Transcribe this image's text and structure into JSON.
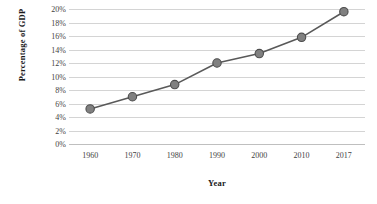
{
  "chart_data": {
    "type": "line",
    "title": "",
    "xlabel": "Year",
    "ylabel": "Percentage of GDP",
    "categories": [
      "1960",
      "1970",
      "1980",
      "1990",
      "2000",
      "2010",
      "2017"
    ],
    "x": [
      1960,
      1970,
      1980,
      1990,
      2000,
      2010,
      2017
    ],
    "values": [
      5.2,
      7.0,
      8.8,
      12.0,
      13.4,
      15.8,
      19.6
    ],
    "series": [
      {
        "name": "Percentage of GDP",
        "values": [
          5.2,
          7.0,
          8.8,
          12.0,
          13.4,
          15.8,
          19.6
        ]
      }
    ],
    "ylim": [
      0,
      20
    ],
    "ytick_labels": [
      "0%",
      "2%",
      "4%",
      "6%",
      "8%",
      "10%",
      "12%",
      "14%",
      "16%",
      "18%",
      "20%"
    ],
    "ytick_values": [
      0,
      2,
      4,
      6,
      8,
      10,
      12,
      14,
      16,
      18,
      20
    ],
    "xtick_labels": [
      "1960",
      "1970",
      "1980",
      "1990",
      "2000",
      "2010",
      "2017"
    ],
    "grid": "horizontal",
    "legend": "none",
    "marker": "circle",
    "colors": {
      "line": "#595959",
      "marker_fill": "#808080",
      "marker_stroke": "#4d4d4d",
      "gridline": "#d4d4d4",
      "axis": "#bfbfbf",
      "tick_label": "#3f3f3f",
      "axis_title": "#1a1a1a",
      "background": "#ffffff"
    }
  }
}
